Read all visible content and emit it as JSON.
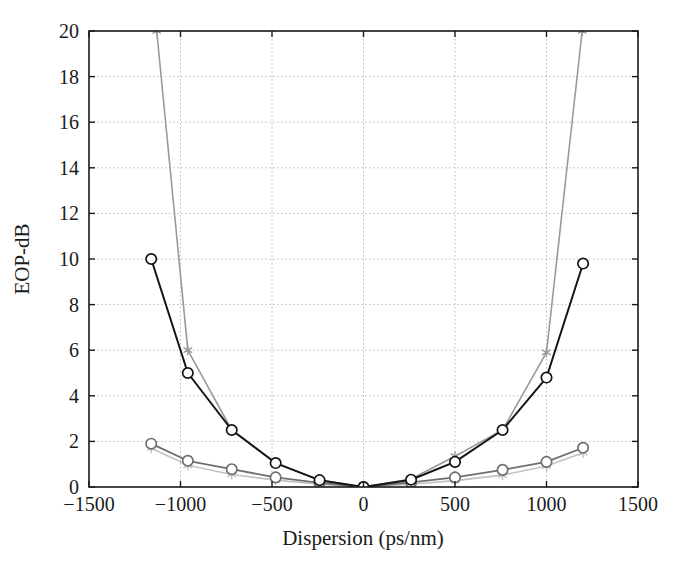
{
  "chart_data": {
    "type": "line",
    "title": "",
    "xlabel": "Dispersion (ps/nm)",
    "ylabel": "EOP-dB",
    "xlim": [
      -1500,
      1500
    ],
    "ylim": [
      0,
      20
    ],
    "xticks": [
      -1500,
      -1000,
      -500,
      0,
      500,
      1000,
      1500
    ],
    "xtick_labels": [
      "−1500",
      "−1000",
      "−500",
      "0",
      "500",
      "1000",
      "1500"
    ],
    "yticks": [
      0,
      2,
      4,
      6,
      8,
      10,
      12,
      14,
      16,
      18,
      20
    ],
    "ytick_labels": [
      "0",
      "2",
      "4",
      "6",
      "8",
      "10",
      "12",
      "14",
      "16",
      "18",
      "20"
    ],
    "grid": true,
    "grid_style": "dotted",
    "grid_color": "#bbbbbb",
    "legend": "none",
    "series": [
      {
        "name": "series-1-black-circle",
        "color": "#141414",
        "marker": "circle-open",
        "marker_face": "#ffffff",
        "line_width": 2.0,
        "points": [
          {
            "x": -1160,
            "y": 10.0
          },
          {
            "x": -960,
            "y": 5.0
          },
          {
            "x": -720,
            "y": 2.5
          },
          {
            "x": -480,
            "y": 1.05
          },
          {
            "x": -240,
            "y": 0.3
          },
          {
            "x": 0,
            "y": 0.0
          },
          {
            "x": 260,
            "y": 0.32
          },
          {
            "x": 500,
            "y": 1.1
          },
          {
            "x": 760,
            "y": 2.5
          },
          {
            "x": 1000,
            "y": 4.8
          },
          {
            "x": 1200,
            "y": 9.8
          }
        ]
      },
      {
        "name": "series-2-gray-star-steep",
        "color": "#9a9a9a",
        "marker": "star",
        "marker_face": "#9a9a9a",
        "line_width": 1.6,
        "points": [
          {
            "x": -1130,
            "y": 20.0
          },
          {
            "x": -960,
            "y": 6.0
          },
          {
            "x": -720,
            "y": 2.5
          },
          {
            "x": -480,
            "y": 1.05
          },
          {
            "x": -240,
            "y": 0.3
          },
          {
            "x": 0,
            "y": 0.0
          },
          {
            "x": 260,
            "y": 0.35
          },
          {
            "x": 500,
            "y": 1.35
          },
          {
            "x": 760,
            "y": 2.5
          },
          {
            "x": 1000,
            "y": 5.9
          },
          {
            "x": 1195,
            "y": 20.0
          }
        ]
      },
      {
        "name": "series-3-darkgray-circle-flat",
        "color": "#6e6e6e",
        "marker": "circle-open",
        "marker_face": "#ffffff",
        "line_width": 1.8,
        "points": [
          {
            "x": -1160,
            "y": 1.9
          },
          {
            "x": -960,
            "y": 1.15
          },
          {
            "x": -720,
            "y": 0.78
          },
          {
            "x": -480,
            "y": 0.42
          },
          {
            "x": -240,
            "y": 0.18
          },
          {
            "x": 0,
            "y": 0.0
          },
          {
            "x": 260,
            "y": 0.2
          },
          {
            "x": 500,
            "y": 0.42
          },
          {
            "x": 760,
            "y": 0.75
          },
          {
            "x": 1000,
            "y": 1.1
          },
          {
            "x": 1200,
            "y": 1.72
          }
        ]
      },
      {
        "name": "series-4-lightgray-star-flat",
        "color": "#c2c2c2",
        "marker": "star",
        "marker_face": "#c2c2c2",
        "line_width": 1.6,
        "points": [
          {
            "x": -1160,
            "y": 1.7
          },
          {
            "x": -960,
            "y": 0.95
          },
          {
            "x": -720,
            "y": 0.55
          },
          {
            "x": -480,
            "y": 0.3
          },
          {
            "x": -240,
            "y": 0.12
          },
          {
            "x": 0,
            "y": 0.0
          },
          {
            "x": 260,
            "y": 0.12
          },
          {
            "x": 500,
            "y": 0.28
          },
          {
            "x": 760,
            "y": 0.52
          },
          {
            "x": 1000,
            "y": 0.92
          },
          {
            "x": 1200,
            "y": 1.5
          }
        ]
      }
    ]
  },
  "plot_box": {
    "left": 89,
    "right": 638,
    "top": 31,
    "bottom": 487,
    "frame_color": "#1a1a1a",
    "frame_width": 1.6,
    "background": "#ffffff"
  }
}
